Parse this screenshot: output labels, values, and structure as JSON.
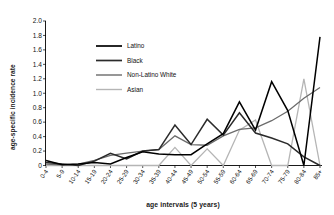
{
  "chart_data": {
    "type": "line",
    "title": "",
    "xlabel": "age intervals (5 years)",
    "ylabel": "age-specific  incidence rate",
    "ylim": [
      0,
      2.0
    ],
    "yticks": [
      "0",
      "0.2",
      "0.4",
      "0.6",
      "0.8",
      "1.0",
      "1.2",
      "1.4",
      "1.6",
      "1.8",
      "2.0"
    ],
    "ytick_values": [
      0,
      0.2,
      0.4,
      0.6,
      0.8,
      1.0,
      1.2,
      1.4,
      1.6,
      1.8,
      2.0
    ],
    "grid": false,
    "legend_position": "upper-left-inside",
    "categories": [
      "0-4",
      "5-9",
      "10-14",
      "15-19",
      "20-24",
      "25-29",
      "30-34",
      "35-39",
      "40-44",
      "45-49",
      "50-54",
      "55-59",
      "60-64",
      "65-69",
      "70-74",
      "75-79",
      "80-84",
      "85+"
    ],
    "series": [
      {
        "name": "Latino",
        "color": "#000000",
        "values": [
          0.07,
          0.01,
          0.02,
          0.04,
          0.02,
          0.11,
          0.19,
          0.16,
          0.15,
          0.15,
          0.3,
          0.44,
          0.88,
          0.49,
          1.16,
          0.76,
          0.0,
          1.78
        ]
      },
      {
        "name": "Black",
        "color": "#2b2b2b",
        "values": [
          0.04,
          0.02,
          0.0,
          0.06,
          0.17,
          0.09,
          0.2,
          0.22,
          0.56,
          0.29,
          0.64,
          0.42,
          0.73,
          0.45,
          0.38,
          0.3,
          0.12,
          0.0
        ]
      },
      {
        "name": "Non-Latino White",
        "color": "#6b6b6b",
        "values": [
          0.02,
          0.01,
          0.02,
          0.07,
          0.14,
          0.17,
          0.2,
          0.22,
          0.41,
          0.29,
          0.28,
          0.41,
          0.5,
          0.52,
          0.62,
          0.75,
          0.93,
          1.08
        ]
      },
      {
        "name": "Asian",
        "color": "#b5b5b5",
        "values": [
          0.0,
          0.0,
          0.0,
          0.0,
          0.0,
          0.0,
          0.0,
          0.0,
          0.25,
          0.0,
          0.23,
          0.0,
          0.49,
          0.63,
          0.0,
          0.0,
          1.2,
          0.0
        ]
      }
    ]
  }
}
